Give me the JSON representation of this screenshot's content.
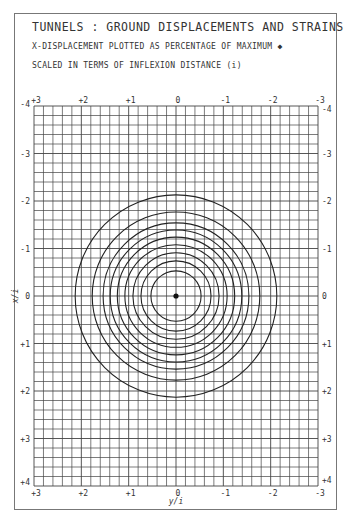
{
  "chart_data": {
    "type": "contour",
    "title": "TUNNELS : GROUND DISPLACEMENTS AND STRAINS",
    "subtitle_lines": [
      "X-DISPLACEMENT PLOTTED AS PERCENTAGE OF MAXIMUM ◆",
      "SCALED IN TERMS OF INFLEXION DISTANCE (i)"
    ],
    "xlabel": "y/i",
    "ylabel": "x/i",
    "x_ticks_top": [
      "+3",
      "+2",
      "+1",
      "0",
      "-1",
      "-2",
      "-3"
    ],
    "x_ticks_bottom": [
      "+3",
      "+2",
      "+1",
      "0",
      "-1",
      "-2",
      "-3"
    ],
    "y_ticks_left": [
      "-4",
      "-3",
      "-2",
      "-1",
      "0",
      "+1",
      "+2",
      "+3",
      "+4"
    ],
    "y_ticks_right": [
      "-4",
      "-3",
      "-2",
      "-1",
      "0",
      "+1",
      "+2",
      "+3",
      "+4"
    ],
    "xlim": [
      3,
      -3
    ],
    "ylim": [
      -4,
      4
    ],
    "grid": true,
    "grid_subdivisions_per_unit": 5,
    "center": {
      "y_over_i": 0,
      "x_over_i": 0,
      "marker": "filled-dot"
    },
    "contour_radii": [
      0.53,
      0.74,
      0.91,
      1.08,
      1.24,
      1.39,
      1.54,
      1.77,
      2.13
    ],
    "contour_shape": "concentric circles"
  },
  "header": {
    "title": "TUNNELS : GROUND DISPLACEMENTS AND STRAINS",
    "line1": "X-DISPLACEMENT PLOTTED AS PERCENTAGE OF MAXIMUM ◆",
    "line2": "SCALED IN TERMS OF INFLEXION DISTANCE (i)"
  }
}
